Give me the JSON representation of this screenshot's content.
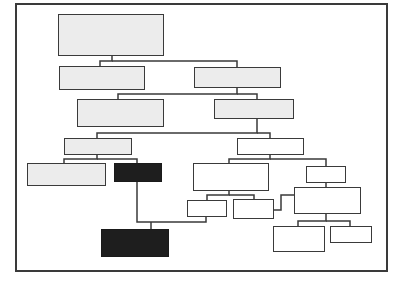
{
  "diagram": {
    "type": "tree",
    "colors": {
      "frame_stroke": "#3a3a3a",
      "edge_stroke": "#3a3a3a",
      "light_fill": "#ececec",
      "white_fill": "#ffffff",
      "dark_fill": "#1e1e1e"
    },
    "frame": {
      "x": 15,
      "y": 3,
      "w": 373,
      "h": 269
    },
    "nodes": [
      {
        "id": "A",
        "style": "light",
        "x": 58,
        "y": 14,
        "w": 106,
        "h": 42
      },
      {
        "id": "B",
        "style": "light",
        "x": 59,
        "y": 66,
        "w": 86,
        "h": 24
      },
      {
        "id": "C",
        "style": "light",
        "x": 194,
        "y": 67,
        "w": 87,
        "h": 21
      },
      {
        "id": "D",
        "style": "light",
        "x": 77,
        "y": 99,
        "w": 87,
        "h": 28
      },
      {
        "id": "E",
        "style": "light",
        "x": 214,
        "y": 99,
        "w": 80,
        "h": 20
      },
      {
        "id": "F",
        "style": "light",
        "x": 64,
        "y": 138,
        "w": 68,
        "h": 17
      },
      {
        "id": "G",
        "style": "white",
        "x": 237,
        "y": 138,
        "w": 67,
        "h": 17
      },
      {
        "id": "H",
        "style": "light",
        "x": 27,
        "y": 163,
        "w": 79,
        "h": 23
      },
      {
        "id": "I",
        "style": "dark",
        "x": 114,
        "y": 163,
        "w": 48,
        "h": 19
      },
      {
        "id": "J",
        "style": "white",
        "x": 193,
        "y": 163,
        "w": 76,
        "h": 28
      },
      {
        "id": "K",
        "style": "white",
        "x": 306,
        "y": 166,
        "w": 40,
        "h": 17
      },
      {
        "id": "L",
        "style": "white",
        "x": 187,
        "y": 200,
        "w": 40,
        "h": 17
      },
      {
        "id": "M",
        "style": "white",
        "x": 233,
        "y": 199,
        "w": 41,
        "h": 20
      },
      {
        "id": "N",
        "style": "white",
        "x": 294,
        "y": 187,
        "w": 67,
        "h": 27
      },
      {
        "id": "O",
        "style": "dark",
        "x": 101,
        "y": 229,
        "w": 68,
        "h": 28
      },
      {
        "id": "P",
        "style": "white",
        "x": 273,
        "y": 226,
        "w": 52,
        "h": 26
      },
      {
        "id": "Q",
        "style": "white",
        "x": 330,
        "y": 226,
        "w": 42,
        "h": 17
      }
    ],
    "edges": [
      {
        "from": "A",
        "to": "B",
        "d": "M112 55 V61 H100 V66"
      },
      {
        "from": "A",
        "to": "C",
        "d": "M112 61 H237 V67"
      },
      {
        "from": "C",
        "to": "D",
        "d": "M237 87 V94 H118 V99"
      },
      {
        "from": "C",
        "to": "E",
        "d": "M237 94 H257 V99"
      },
      {
        "from": "E",
        "to": "F",
        "d": "M257 118 V133 H97 V138"
      },
      {
        "from": "E",
        "to": "G",
        "d": "M257 133 H270 V138"
      },
      {
        "from": "F",
        "to": "H",
        "d": "M97 154 V159 H64 V163"
      },
      {
        "from": "F",
        "to": "I",
        "d": "M97 159 H137 V163"
      },
      {
        "from": "G",
        "to": "J",
        "d": "M270 154 V159 H229 V163"
      },
      {
        "from": "G",
        "to": "K",
        "d": "M270 159 H326 V166"
      },
      {
        "from": "J",
        "to": "L",
        "d": "M229 190 V195 H207 V200"
      },
      {
        "from": "J",
        "to": "M",
        "d": "M229 195 H254 V199"
      },
      {
        "from": "K",
        "to": "N",
        "d": "M326 182 V187"
      },
      {
        "from": "M",
        "to": "N",
        "d": "M273 210 H281 V195 H294"
      },
      {
        "from": "N",
        "to": "P",
        "d": "M326 213 V221 H298 V226"
      },
      {
        "from": "N",
        "to": "Q",
        "d": "M326 221 H350 V226"
      },
      {
        "from": "I",
        "to": "O",
        "d": "M137 181 V222 H206 V216"
      },
      {
        "from": "I",
        "to": "O-drop",
        "d": "M151 222 V229"
      }
    ]
  }
}
